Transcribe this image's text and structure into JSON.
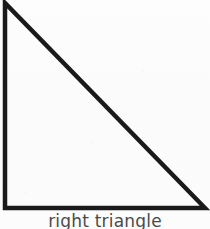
{
  "figure": {
    "shape_name": "right-triangle",
    "caption": "right triangle",
    "caption_clipped": true,
    "stroke_color": "#1a1a1a",
    "fill_color": "none",
    "background_color": "#fdfdfd",
    "caption_color": "#4a4a4a",
    "stroke_width": 4.5,
    "canvas": {
      "width": 210,
      "height": 229
    },
    "geometry": {
      "type": "polygon",
      "vertices": [
        {
          "label": "apex-top-left",
          "x": 5,
          "y": 3
        },
        {
          "label": "right-angle-bottom-left",
          "x": 5,
          "y": 208
        },
        {
          "label": "vertex-bottom-right",
          "x": 205,
          "y": 208
        }
      ],
      "right_angle_at": "right-angle-bottom-left",
      "edges": [
        {
          "name": "vertical-leg",
          "from": "apex-top-left",
          "to": "right-angle-bottom-left"
        },
        {
          "name": "horizontal-leg",
          "from": "right-angle-bottom-left",
          "to": "vertex-bottom-right"
        },
        {
          "name": "hypotenuse",
          "from": "vertex-bottom-right",
          "to": "apex-top-left"
        }
      ]
    }
  }
}
